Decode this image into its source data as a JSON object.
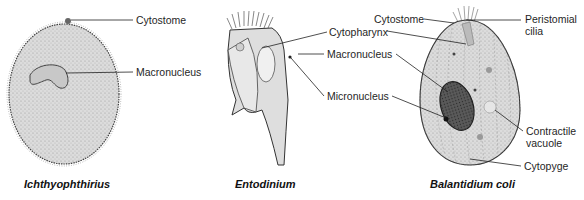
{
  "figure_number": "",
  "organisms": [
    {
      "name": "Ichthyophthirius",
      "labels": [
        "Cytostome",
        "Macronucleus"
      ]
    },
    {
      "name": "Entodinium",
      "labels": [
        "Cytopharynx",
        "Macronucleus",
        "Micronucleus"
      ]
    },
    {
      "name": "Balantidium coli",
      "labels": [
        "Cytostome",
        "Peristomial cilia",
        "Contractile vacuole",
        "Cytopyge"
      ]
    }
  ],
  "labels": {
    "ich_cytostome": "Cytostome",
    "ich_macronucleus": "Macronucleus",
    "ento_cytopharynx": "Cytopharynx",
    "ento_macronucleus": "Macronucleus",
    "ento_micronucleus": "Micronucleus",
    "bal_cytostome": "Cytostome",
    "bal_peristomial_1": "Peristomial",
    "bal_peristomial_2": "cilia",
    "bal_contractile_1": "Contractile",
    "bal_contractile_2": "vacuole",
    "bal_cytopyge": "Cytopyge"
  },
  "captions": {
    "ich": "Ichthyophthirius",
    "ento": "Entodinium",
    "bal": "Balantidium coli"
  },
  "colors": {
    "cell_fill": "#d9d9d9",
    "outline": "#333333",
    "nucleus_fill": "#4a4a4a",
    "leader": "#222222"
  }
}
